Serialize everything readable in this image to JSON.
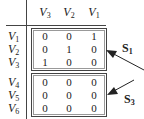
{
  "columns": [
    {
      "name": "V",
      "sub": "3"
    },
    {
      "name": "V",
      "sub": "2"
    },
    {
      "name": "V",
      "sub": "1"
    }
  ],
  "rows": [
    {
      "name": "V",
      "sub": "1",
      "values": [
        "0",
        "0",
        "1"
      ]
    },
    {
      "name": "V",
      "sub": "2",
      "values": [
        "0",
        "1",
        "0"
      ]
    },
    {
      "name": "V",
      "sub": "3",
      "values": [
        "1",
        "0",
        "0"
      ]
    },
    {
      "name": "V",
      "sub": "4",
      "values": [
        "0",
        "0",
        "0"
      ]
    },
    {
      "name": "V",
      "sub": "5",
      "values": [
        "0",
        "0",
        "0"
      ]
    },
    {
      "name": "V",
      "sub": "6",
      "values": [
        "0",
        "0",
        "0"
      ]
    }
  ],
  "groups": [
    {
      "label": "S",
      "sub": "1",
      "rows": [
        1,
        2,
        3
      ]
    },
    {
      "label": "S",
      "sub": "3",
      "rows": [
        4,
        5,
        6
      ]
    }
  ]
}
